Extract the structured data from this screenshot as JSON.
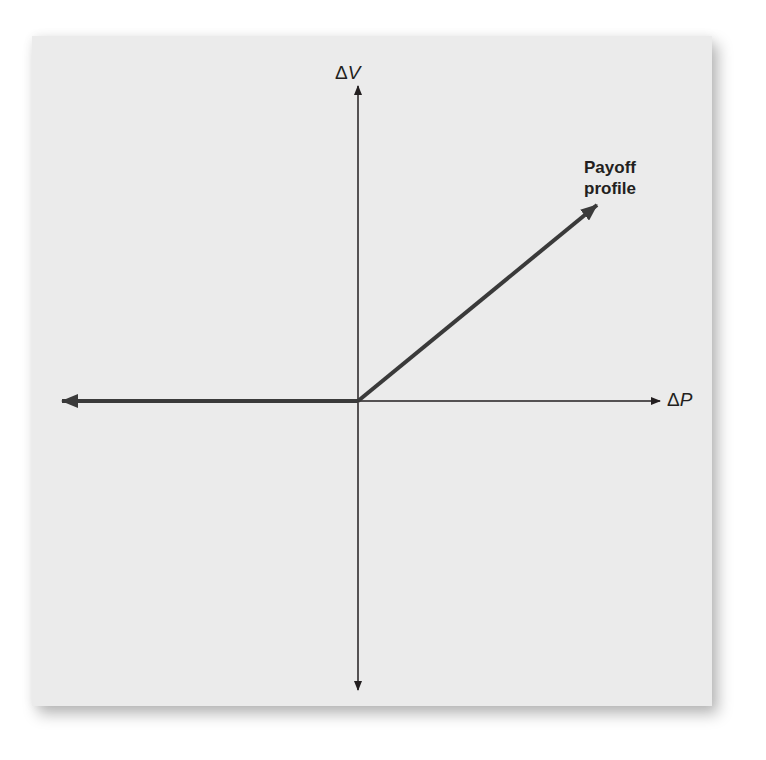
{
  "diagram": {
    "type": "payoff-diagram",
    "y_axis": {
      "symbol": "Δ",
      "var": "V"
    },
    "x_axis": {
      "symbol": "Δ",
      "var": "P"
    },
    "annotation": {
      "line1": "Payoff",
      "line2": "profile"
    },
    "colors": {
      "background": "#ebebeb",
      "axis": "#231f20",
      "payoff_line": "#3a3a3a"
    },
    "geometry": {
      "origin": [
        358,
        401
      ],
      "payoff_left_end": [
        60,
        401
      ],
      "payoff_right_end": [
        597,
        205
      ],
      "y_axis_top": 84,
      "y_axis_bottom": 692,
      "x_axis_right": 660
    }
  }
}
